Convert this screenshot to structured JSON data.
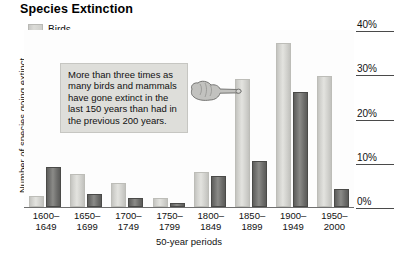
{
  "title": "Species Extinction",
  "ylabel": "Number of species going extinct",
  "xlabel": "50-year periods",
  "legend": {
    "items": [
      {
        "label": "Birds",
        "key": "birds",
        "color": "#d8d8d4",
        "icon": "legend-swatch-birds"
      },
      {
        "label": "Mammals",
        "key": "mammals",
        "color": "#7a7a77",
        "icon": "legend-swatch-mammals"
      }
    ]
  },
  "callout": {
    "text": "More than three times as many birds and mammals have gone extinct in the last 150 years than had in the previous 200 years.",
    "icon": "pointing-hand-icon"
  },
  "yticks": [
    {
      "label": "40%",
      "value": 40
    },
    {
      "label": "30%",
      "value": 30
    },
    {
      "label": "20%",
      "value": 20
    },
    {
      "label": "10%",
      "value": 10
    },
    {
      "label": "0%",
      "value": 0
    }
  ],
  "xticks": [
    {
      "line1": "1600–",
      "line2": "1649"
    },
    {
      "line1": "1650–",
      "line2": "1699"
    },
    {
      "line1": "1700–",
      "line2": "1749"
    },
    {
      "line1": "1750–",
      "line2": "1799"
    },
    {
      "line1": "1800–",
      "line2": "1849"
    },
    {
      "line1": "1850–",
      "line2": "1899"
    },
    {
      "line1": "1900–",
      "line2": "1949"
    },
    {
      "line1": "1950–",
      "line2": "2000"
    }
  ],
  "chart_data": {
    "type": "bar",
    "title": "Species Extinction",
    "xlabel": "50-year periods",
    "ylabel": "Number of species going extinct",
    "ylim": [
      0,
      40
    ],
    "ytick_labels": [
      "0%",
      "10%",
      "20%",
      "30%",
      "40%"
    ],
    "ytick_values": [
      0,
      10,
      20,
      30,
      40
    ],
    "grid": false,
    "legend_position": "top-left",
    "categories": [
      "1600–1649",
      "1650–1699",
      "1700–1749",
      "1750–1799",
      "1800–1849",
      "1850–1899",
      "1900–1949",
      "1950–2000"
    ],
    "series": [
      {
        "name": "Birds",
        "color": "#d8d8d4",
        "values": [
          2.5,
          7.5,
          5.5,
          2.0,
          8.0,
          29.0,
          37.0,
          29.5
        ]
      },
      {
        "name": "Mammals",
        "color": "#7a7a77",
        "values": [
          9.0,
          3.0,
          2.0,
          0.8,
          7.0,
          10.5,
          26.0,
          4.0
        ]
      }
    ],
    "annotations": [
      {
        "type": "callout",
        "text": "More than three times as many birds and mammals have gone extinct in the last 150 years than had in the previous 200 years.",
        "points_to": "1850–1899"
      }
    ]
  }
}
